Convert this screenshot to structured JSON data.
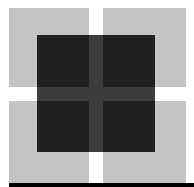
{
  "figure": {
    "colors": {
      "background": "#ffffff",
      "light_square": "#c4c4c4",
      "dark_quadrant": "#1f1f1f",
      "dark_cross": "#3d3d3d",
      "bottom_bar": "#000000"
    },
    "light_squares": [
      {
        "x": 9,
        "y": 8,
        "w": 80,
        "h": 79
      },
      {
        "x": 103,
        "y": 8,
        "w": 83,
        "h": 79
      },
      {
        "x": 9,
        "y": 101,
        "w": 80,
        "h": 82
      },
      {
        "x": 103,
        "y": 101,
        "w": 83,
        "h": 82
      }
    ],
    "dark_box": {
      "x": 37,
      "y": 35,
      "w": 118,
      "h": 117
    },
    "cross_vertical": {
      "x": 89,
      "w": 14
    },
    "cross_horizontal": {
      "y": 87,
      "h": 14
    },
    "bottom_bar": {
      "x": 9,
      "y": 183,
      "w": 185,
      "h": 4
    }
  }
}
